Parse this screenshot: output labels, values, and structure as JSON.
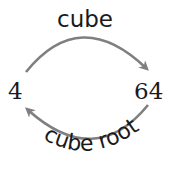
{
  "diagram": {
    "left_value": "4",
    "right_value": "64",
    "top_label": "cube",
    "bottom_label": "cube root",
    "arrow_color": "#7f7f7f",
    "text_color": "#1a1a1a"
  }
}
